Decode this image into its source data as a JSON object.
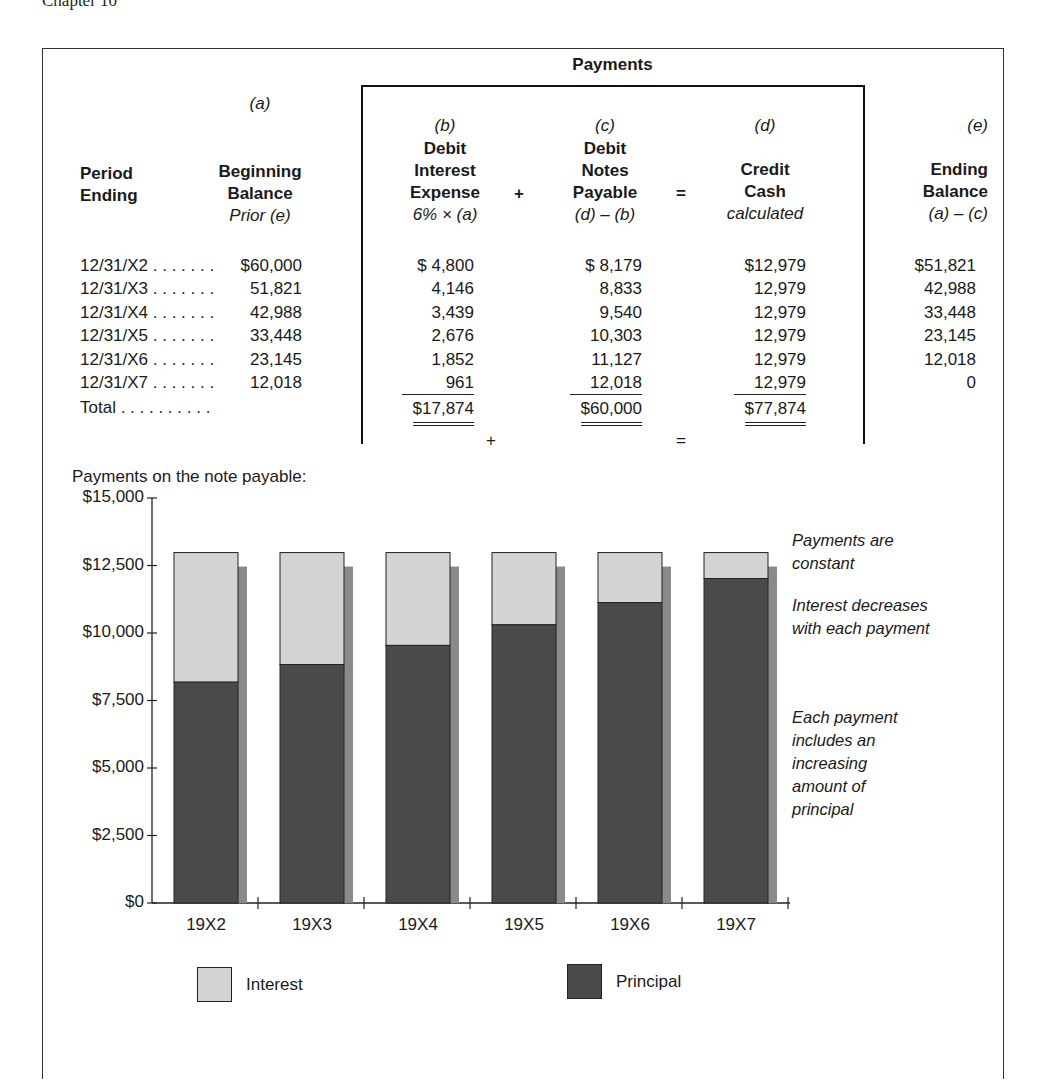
{
  "running_head": "Chapter 10",
  "table": {
    "payments_title": "Payments",
    "columns": {
      "period": {
        "line1": "Period",
        "line2": "Ending"
      },
      "a": {
        "letter": "(a)",
        "line1": "Beginning",
        "line2": "Balance",
        "formula": "Prior (e)"
      },
      "b": {
        "letter": "(b)",
        "line1": "Debit",
        "line2": "Interest",
        "line3": "Expense",
        "formula": "6% × (a)"
      },
      "c": {
        "letter": "(c)",
        "line1": "Debit",
        "line2": "Notes",
        "line3": "Payable",
        "formula": "(d) – (b)"
      },
      "d": {
        "letter": "(d)",
        "line1": "Credit",
        "line2": "Cash",
        "formula": "calculated"
      },
      "e": {
        "letter": "(e)",
        "line1": "Ending",
        "line2": "Balance",
        "formula": "(a) – (c)"
      }
    },
    "operators": {
      "plus": "+",
      "equals": "="
    },
    "rows": [
      {
        "period": "12/31/X2 . . . . . . .",
        "a": "$60,000",
        "b": "$ 4,800",
        "c": "$ 8,179",
        "d": "$12,979",
        "e": "$51,821"
      },
      {
        "period": "12/31/X3 . . . . . . .",
        "a": "51,821",
        "b": "4,146",
        "c": "8,833",
        "d": "12,979",
        "e": "42,988"
      },
      {
        "period": "12/31/X4 . . . . . . .",
        "a": "42,988",
        "b": "3,439",
        "c": "9,540",
        "d": "12,979",
        "e": "33,448"
      },
      {
        "period": "12/31/X5 . . . . . . .",
        "a": "33,448",
        "b": "2,676",
        "c": "10,303",
        "d": "12,979",
        "e": "23,145"
      },
      {
        "period": "12/31/X6 . . . . . . .",
        "a": "23,145",
        "b": "1,852",
        "c": "11,127",
        "d": "12,979",
        "e": "12,018"
      },
      {
        "period": "12/31/X7 . . . . . . .",
        "a": "12,018",
        "b": "961",
        "c": "12,018",
        "d": "12,979",
        "e": "0"
      }
    ],
    "total": {
      "label": "Total . . . . . . . . . .",
      "b": "$17,874",
      "c": "$60,000",
      "d": "$77,874"
    }
  },
  "chart_data": {
    "type": "bar",
    "stacked": true,
    "title": "Payments on the note payable:",
    "xlabel": "",
    "ylabel": "",
    "categories": [
      "19X2",
      "19X3",
      "19X4",
      "19X5",
      "19X6",
      "19X7"
    ],
    "series": [
      {
        "name": "Principal",
        "values": [
          8179,
          8833,
          9540,
          10303,
          11127,
          12018
        ],
        "color": "#4a4a4a"
      },
      {
        "name": "Interest",
        "values": [
          4800,
          4146,
          3439,
          2676,
          1852,
          961
        ],
        "color": "#d4d4d4"
      }
    ],
    "ylim": [
      0,
      15000
    ],
    "yticks": [
      "$0",
      "$2,500",
      "$5,000",
      "$7,500",
      "$10,000",
      "$12,500",
      "$15,000"
    ],
    "ytick_values": [
      0,
      2500,
      5000,
      7500,
      10000,
      12500,
      15000
    ],
    "grid": false,
    "legend_position": "bottom",
    "annotations": [
      "Payments are constant",
      "Interest decreases with each payment",
      "Each payment includes an increasing amount of principal"
    ]
  },
  "notes": {
    "n1": [
      "Payments are",
      "constant"
    ],
    "n2": [
      "Interest decreases",
      "with each payment"
    ],
    "n3": [
      "Each payment",
      "includes an",
      "increasing",
      "amount of",
      "principal"
    ]
  },
  "legend": {
    "interest": "Interest",
    "principal": "Principal"
  },
  "colors": {
    "interest": "#d4d4d4",
    "principal": "#4a4a4a",
    "shadow": "#8a8a8a",
    "ink": "#1a1a1a"
  }
}
